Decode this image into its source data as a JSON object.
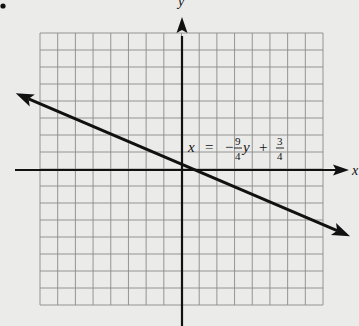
{
  "chart_data": {
    "type": "line",
    "title": "",
    "xlabel": "x",
    "ylabel": "y",
    "grid": true,
    "grid_columns": 16,
    "grid_rows": 16,
    "xlim": [
      -8,
      8
    ],
    "ylim": [
      -8,
      8
    ],
    "series": [
      {
        "name": "x = -9/4 y + 3/4",
        "equation": "x = -(9/4)y + 3/4",
        "slope_y_per_x": -0.4444,
        "y_intercept": 0.3333,
        "x_intercept": 0.75,
        "x": [
          -9.4,
          0,
          0.75,
          9.5
        ],
        "values": [
          4.51,
          0.33,
          0,
          -3.89
        ],
        "arrows": "both"
      }
    ],
    "annotations": [
      {
        "text_parts": [
          "x",
          "=",
          "−",
          "9",
          "4",
          "y",
          "+",
          "3",
          "4"
        ],
        "display": "x = −(9/4)y + 3/4",
        "position": "above line, right of y-axis"
      }
    ]
  },
  "labels": {
    "x_axis": "x",
    "y_axis": "y",
    "equation": {
      "lhs": "x",
      "eq": "=",
      "minus": "−",
      "frac1_num": "9",
      "frac1_den": "4",
      "var": "y",
      "plus": "+",
      "frac2_num": "3",
      "frac2_den": "4"
    }
  },
  "style": {
    "background": "#ebebea",
    "grid_color": "#8a8a8a",
    "axis_color": "#111111",
    "line_color": "#111111"
  }
}
